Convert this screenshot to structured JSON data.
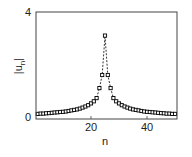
{
  "chart_data": {
    "type": "line",
    "title": "",
    "xlabel": "n",
    "ylabel": "|u_n|",
    "xlim": [
      1,
      50
    ],
    "ylim": [
      0,
      4
    ],
    "xticks": [
      20,
      40
    ],
    "yticks": [
      0,
      4
    ],
    "grid": false,
    "legend": null,
    "series": [
      {
        "name": "|u_n|",
        "marker": "square-open",
        "line_style": "dashed",
        "color": "#000000",
        "x": [
          1,
          2,
          3,
          4,
          5,
          6,
          7,
          8,
          9,
          10,
          11,
          12,
          13,
          14,
          15,
          16,
          17,
          18,
          19,
          20,
          21,
          22,
          23,
          24,
          25,
          26,
          27,
          28,
          29,
          30,
          31,
          32,
          33,
          34,
          35,
          36,
          37,
          38,
          39,
          40,
          41,
          42,
          43,
          44,
          45,
          46,
          47,
          48,
          49,
          50
        ],
        "values": [
          0.12,
          0.13,
          0.13,
          0.14,
          0.15,
          0.16,
          0.17,
          0.18,
          0.19,
          0.2,
          0.21,
          0.23,
          0.25,
          0.27,
          0.29,
          0.32,
          0.36,
          0.4,
          0.45,
          0.52,
          0.6,
          0.72,
          1.1,
          1.6,
          3.1,
          1.6,
          1.1,
          0.72,
          0.6,
          0.52,
          0.45,
          0.4,
          0.36,
          0.32,
          0.29,
          0.27,
          0.25,
          0.23,
          0.21,
          0.2,
          0.19,
          0.18,
          0.17,
          0.16,
          0.15,
          0.14,
          0.13,
          0.13,
          0.12,
          0.12
        ]
      }
    ]
  }
}
